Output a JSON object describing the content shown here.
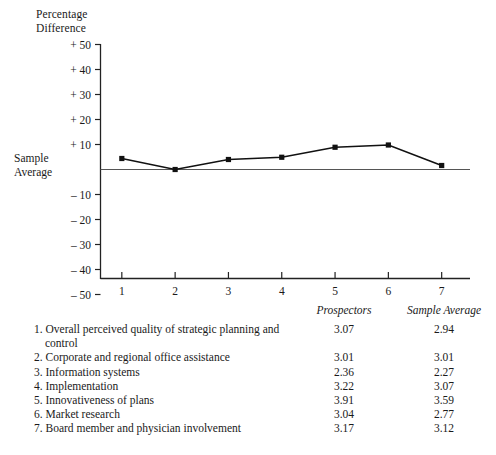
{
  "chart_data": {
    "type": "line",
    "title": "",
    "ylabel": "Percentage\nDifference",
    "xlabel": "",
    "zero_line_label": "Sample\nAverage",
    "x": [
      1,
      2,
      3,
      4,
      5,
      6,
      7
    ],
    "xticklabels": [
      "1",
      "2",
      "3",
      "4",
      "5",
      "6",
      "7"
    ],
    "yticklabels": [
      "+ 50",
      "+ 40",
      "+ 30",
      "+ 20",
      "+ 10",
      "– 10",
      "– 20",
      "– 30",
      "– 40",
      "– 50"
    ],
    "ytickvalues": [
      50,
      40,
      30,
      20,
      10,
      -10,
      -20,
      -30,
      -40,
      -50
    ],
    "ylim": [
      -50,
      50
    ],
    "xlim": [
      0.6,
      7.4
    ],
    "grid": false,
    "legend": false,
    "series": [
      {
        "name": "Prospectors percentage difference from sample average",
        "values": [
          4.4,
          0.0,
          4.0,
          4.9,
          8.9,
          9.8,
          1.6
        ]
      }
    ],
    "marker": "square",
    "line_color": "#111111",
    "zero_line_color": "#555555"
  },
  "table": {
    "headers": {
      "items": "",
      "prospectors": "Prospectors",
      "sample_average": "Sample Average"
    },
    "rows": [
      {
        "label": "1. Overall perceived quality of strategic planning and control",
        "prospectors": "3.07",
        "sample_average": "2.94"
      },
      {
        "label": "2. Corporate and regional office assistance",
        "prospectors": "3.01",
        "sample_average": "3.01"
      },
      {
        "label": "3. Information systems",
        "prospectors": "2.36",
        "sample_average": "2.27"
      },
      {
        "label": "4. Implementation",
        "prospectors": "3.22",
        "sample_average": "3.07"
      },
      {
        "label": "5. Innovativeness of plans",
        "prospectors": "3.91",
        "sample_average": "3.59"
      },
      {
        "label": "6. Market research",
        "prospectors": "3.04",
        "sample_average": "2.77"
      },
      {
        "label": "7. Board member and physician involvement",
        "prospectors": "3.17",
        "sample_average": "3.12"
      }
    ]
  }
}
